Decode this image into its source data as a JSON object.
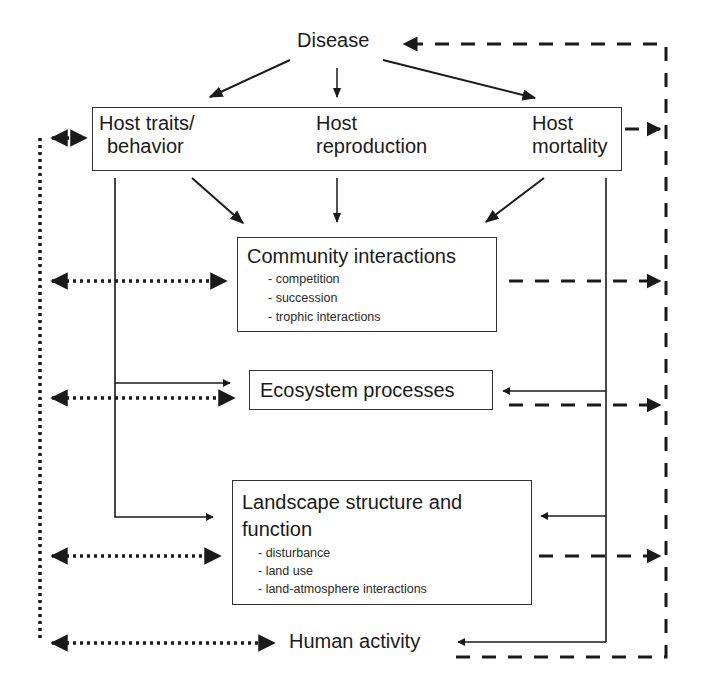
{
  "diagram": {
    "nodes": {
      "disease": {
        "label": "Disease"
      },
      "host_traits": {
        "line1": "Host traits/",
        "line2": "behavior"
      },
      "host_reproduction": {
        "line1": "Host",
        "line2": "reproduction"
      },
      "host_mortality": {
        "line1": "Host",
        "line2": "mortality"
      },
      "community": {
        "title": "Community interactions",
        "items": [
          "- competition",
          "- succession",
          "- trophic interactions"
        ]
      },
      "ecosystem": {
        "title": "Ecosystem processes"
      },
      "landscape": {
        "title_line1": "Landscape structure and",
        "title_line2": "function",
        "items": [
          "- disturbance",
          "- land use",
          "- land-atmosphere interactions"
        ]
      },
      "human": {
        "label": "Human activity"
      }
    },
    "edge_styles": {
      "solid": "direct effect",
      "dotted": "bidirectional link with human activity",
      "dashed": "feedback to disease"
    },
    "colors": {
      "line": "#1a1a1a",
      "box_border": "#333333",
      "background": "#ffffff"
    }
  }
}
